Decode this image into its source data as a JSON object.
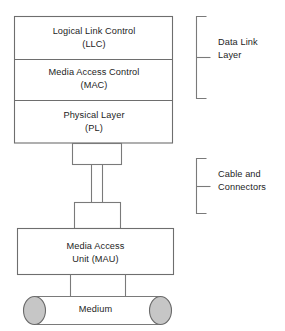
{
  "diagram": {
    "type": "layered-stack-diagram",
    "colors": {
      "background": "#ffffff",
      "box_stroke": "#6e6e6e",
      "box_fill": "#ffffff",
      "text": "#1d1d1d",
      "cylinder_cap_fill": "#c6c6c6",
      "cylinder_cap_stroke": "#6a6a6a"
    },
    "layers": [
      {
        "id": "llc",
        "line1": "Logical Link Control",
        "line2": "(LLC)",
        "text": "Logical Link Control\n(LLC)"
      },
      {
        "id": "mac",
        "line1": "Media Access Control",
        "line2": "(MAC)",
        "text": "Media Access Control\n(MAC)"
      },
      {
        "id": "pl",
        "line1": "Physical Layer",
        "line2": "(PL)",
        "text": "Physical Layer\n(PL)"
      }
    ],
    "mau": {
      "id": "mau",
      "line1": "Media Access",
      "line2": "Unit (MAU)",
      "text": "Media Access\nUnit (MAU)"
    },
    "medium": {
      "id": "medium",
      "label": "Medium"
    },
    "brackets": [
      {
        "id": "data-link-layer",
        "line1": "Data Link",
        "line2": "Layer",
        "text": "Data Link\nLayer",
        "spans": [
          "llc",
          "mac"
        ]
      },
      {
        "id": "cable-and-connectors",
        "line1": "Cable and",
        "line2": "Connectors",
        "text": "Cable and\nConnectors",
        "spans": [
          "upper-connector",
          "cable",
          "lower-connector"
        ]
      }
    ],
    "connectors": [
      {
        "id": "upper-connector",
        "label": ""
      },
      {
        "id": "lower-connector",
        "label": ""
      }
    ]
  }
}
